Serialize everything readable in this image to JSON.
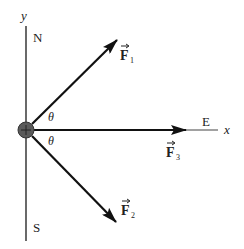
{
  "diagram": {
    "axes": {
      "y_label": "y",
      "x_label": "x",
      "north_label": "N",
      "south_label": "S",
      "east_label": "E"
    },
    "angles": [
      {
        "symbol": "θ",
        "between": "F1 and x-axis"
      },
      {
        "symbol": "θ",
        "between": "F2 and x-axis"
      }
    ],
    "forces": [
      {
        "name": "F1",
        "letter": "F",
        "subscript": "1",
        "direction": "up-right"
      },
      {
        "name": "F2",
        "letter": "F",
        "subscript": "2",
        "direction": "down-right"
      },
      {
        "name": "F3",
        "letter": "F",
        "subscript": "3",
        "direction": "east"
      }
    ],
    "colors": {
      "line": "#333333",
      "arrow": "#111111",
      "particle": "#555555"
    }
  }
}
